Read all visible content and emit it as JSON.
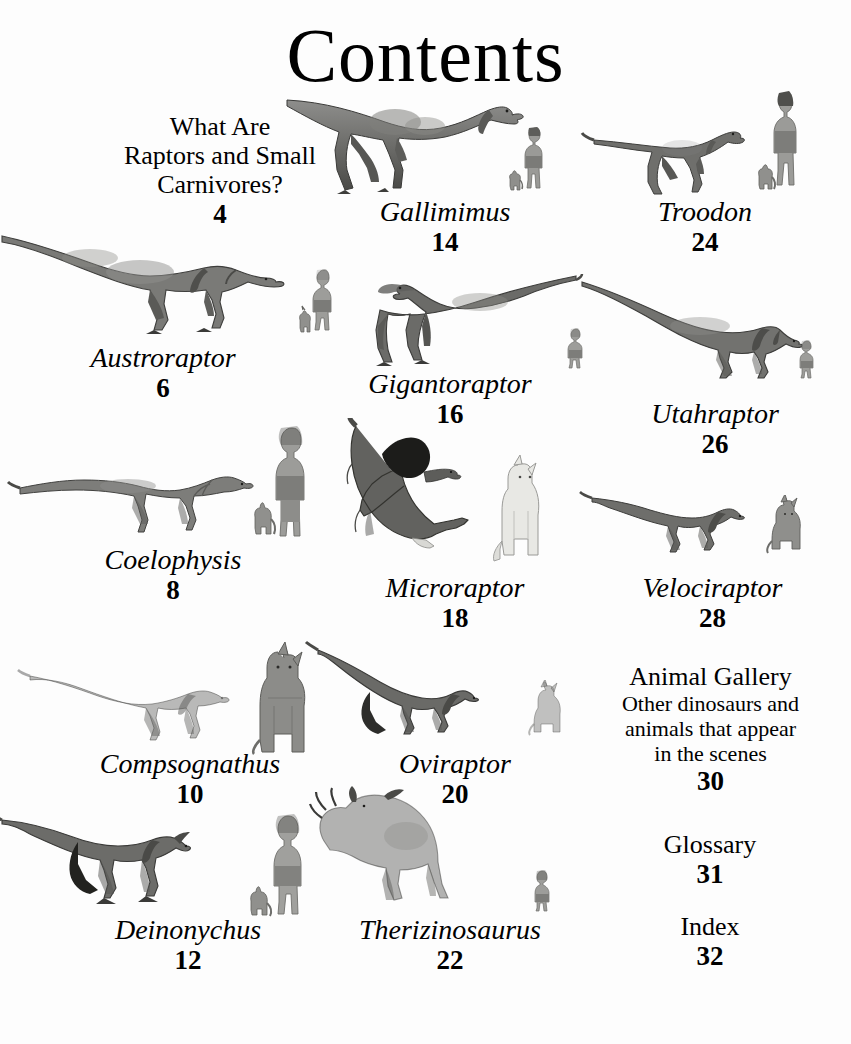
{
  "page": {
    "title": "Contents",
    "background_color": "#fdfdfd",
    "text_color": "#000000"
  },
  "entries": [
    {
      "id": "what-are-raptors",
      "kind": "section",
      "lines": [
        "What Are",
        "Raptors and Small",
        "Carnivores?"
      ],
      "name": "What Are Raptors and Small Carnivores?",
      "page_number": "4"
    },
    {
      "id": "gallimimus",
      "kind": "dinosaur",
      "name": "Gallimimus",
      "page_number": "14",
      "scale_figures": [
        "child",
        "cat"
      ]
    },
    {
      "id": "troodon",
      "kind": "dinosaur",
      "name": "Troodon",
      "page_number": "24",
      "scale_figures": [
        "child",
        "cat"
      ]
    },
    {
      "id": "austroraptor",
      "kind": "dinosaur",
      "name": "Austroraptor",
      "page_number": "6",
      "scale_figures": [
        "child",
        "cat"
      ]
    },
    {
      "id": "gigantoraptor",
      "kind": "dinosaur",
      "name": "Gigantoraptor",
      "page_number": "16",
      "scale_figures": [
        "child"
      ]
    },
    {
      "id": "utahraptor",
      "kind": "dinosaur",
      "name": "Utahraptor",
      "page_number": "26",
      "scale_figures": [
        "child"
      ]
    },
    {
      "id": "coelophysis",
      "kind": "dinosaur",
      "name": "Coelophysis",
      "page_number": "8",
      "scale_figures": [
        "child",
        "cat"
      ]
    },
    {
      "id": "microraptor",
      "kind": "dinosaur",
      "name": "Microraptor",
      "page_number": "18",
      "scale_figures": [
        "cat"
      ]
    },
    {
      "id": "velociraptor",
      "kind": "dinosaur",
      "name": "Velociraptor",
      "page_number": "28",
      "scale_figures": [
        "cat"
      ]
    },
    {
      "id": "compsognathus",
      "kind": "dinosaur",
      "name": "Compsognathus",
      "page_number": "10",
      "scale_figures": [
        "cat"
      ]
    },
    {
      "id": "oviraptor",
      "kind": "dinosaur",
      "name": "Oviraptor",
      "page_number": "20",
      "scale_figures": [
        "cat"
      ]
    },
    {
      "id": "animal-gallery",
      "kind": "section",
      "name": "Animal Gallery",
      "description_lines": [
        "Other dinosaurs and",
        "animals that appear",
        "in the scenes"
      ],
      "page_number": "30"
    },
    {
      "id": "deinonychus",
      "kind": "dinosaur",
      "name": "Deinonychus",
      "page_number": "12",
      "scale_figures": [
        "child",
        "cat"
      ]
    },
    {
      "id": "therizinosaurus",
      "kind": "dinosaur",
      "name": "Therizinosaurus",
      "page_number": "22",
      "scale_figures": [
        "child"
      ]
    },
    {
      "id": "glossary",
      "kind": "section",
      "name": "Glossary",
      "page_number": "31"
    },
    {
      "id": "index",
      "kind": "section",
      "name": "Index",
      "page_number": "32"
    }
  ]
}
